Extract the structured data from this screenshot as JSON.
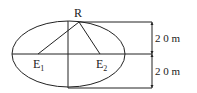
{
  "diagram": {
    "labels": {
      "top_point": "R",
      "left_point": "E",
      "left_sub": "1",
      "right_point": "E",
      "right_sub": "2",
      "upper_dimension": "2 0 m",
      "lower_dimension": "2 0 m"
    },
    "colors": {
      "stroke": "#222222",
      "background": "#ffffff"
    }
  }
}
